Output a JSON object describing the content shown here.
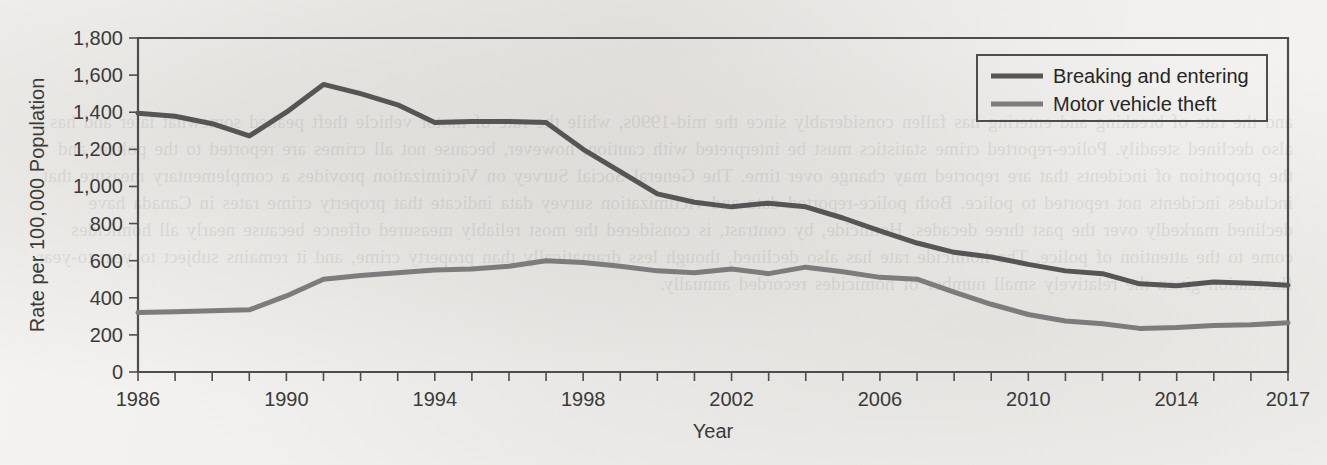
{
  "figure": {
    "background_color": "#f2f1ef",
    "frame_color": "#4d4d4d"
  },
  "bleed_through_text": "and the rate of breaking and entering has fallen considerably since the mid-1990s, while the rate of motor vehicle theft peaked somewhat later and has also declined steadily. Police-reported crime statistics must be interpreted with caution, however, because not all crimes are reported to the police, and the proportion of incidents that are reported may change over time. The General Social Survey on Victimization provides a complementary measure that includes incidents not reported to police. Both police-reported data and victimization survey data indicate that property crime rates in Canada have declined markedly over the past three decades. Homicide, by contrast, is considered the most reliably measured offence because nearly all homicides come to the attention of police. The homicide rate has also declined, though less dramatically than property crime, and it remains subject to year-to-year fluctuation given the relatively small number of homicides recorded annually.",
  "chart_data": {
    "type": "line",
    "title": "",
    "xlabel": "Year",
    "ylabel": "Rate per 100,000 Population",
    "xlim": [
      1986,
      2017
    ],
    "ylim": [
      0,
      1800
    ],
    "ytick_step": 200,
    "grid": false,
    "legend_position": "top-right",
    "x": [
      1986,
      1987,
      1988,
      1989,
      1990,
      1991,
      1992,
      1993,
      1994,
      1995,
      1996,
      1997,
      1998,
      1999,
      2000,
      2001,
      2002,
      2003,
      2004,
      2005,
      2006,
      2007,
      2008,
      2009,
      2010,
      2011,
      2012,
      2013,
      2014,
      2015,
      2016,
      2017
    ],
    "ytick_labels": [
      "0",
      "200",
      "400",
      "600",
      "800",
      "1,000",
      "1,200",
      "1,400",
      "1,600",
      "1,800"
    ],
    "ytick_values": [
      0,
      200,
      400,
      600,
      800,
      1000,
      1200,
      1400,
      1600,
      1800
    ],
    "xtick_labels": [
      "1986",
      "1990",
      "1994",
      "1998",
      "2002",
      "2006",
      "2010",
      "2014",
      "2017"
    ],
    "xtick_values": [
      1986,
      1990,
      1994,
      1998,
      2002,
      2006,
      2010,
      2014,
      2017
    ],
    "series": [
      {
        "name": "Breaking and entering",
        "color": "#555555",
        "stroke_width": 5,
        "values": [
          1395,
          1378,
          1338,
          1272,
          1400,
          1550,
          1500,
          1440,
          1345,
          1350,
          1350,
          1345,
          1200,
          1080,
          960,
          915,
          890,
          910,
          890,
          830,
          760,
          695,
          645,
          620,
          580,
          545,
          530,
          475,
          465,
          485,
          478,
          468
        ]
      },
      {
        "name": "Motor vehicle theft",
        "color": "#7c7c7c",
        "stroke_width": 5,
        "values": [
          320,
          325,
          330,
          335,
          410,
          500,
          520,
          535,
          550,
          555,
          570,
          600,
          590,
          570,
          545,
          535,
          555,
          530,
          565,
          540,
          510,
          500,
          430,
          365,
          310,
          275,
          260,
          235,
          240,
          250,
          255,
          265
        ]
      }
    ]
  }
}
